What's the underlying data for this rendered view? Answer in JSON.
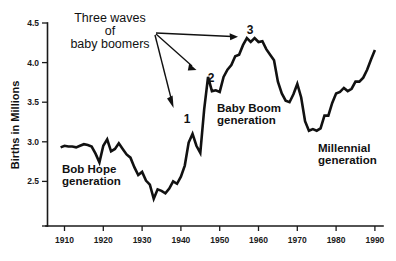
{
  "chart_data": {
    "type": "line",
    "title": "",
    "subtitle": "",
    "xlabel": "",
    "ylabel": "Births in Millions",
    "xlim": [
      1905,
      1992
    ],
    "ylim": [
      2.22,
      4.55
    ],
    "grid": false,
    "legend_position": "none",
    "xticks": [
      "1910",
      "1920",
      "1930",
      "1940",
      "1950",
      "1960",
      "1970",
      "1980",
      "1990"
    ],
    "xtick_values": [
      1910,
      1920,
      1930,
      1940,
      1950,
      1960,
      1970,
      1980,
      1990
    ],
    "yticks": [
      "2.5",
      "3.0",
      "3.5",
      "4.0",
      "4.5"
    ],
    "ytick_values": [
      2.5,
      3.0,
      3.5,
      4.0,
      4.5
    ],
    "series": [
      {
        "name": "Births in Millions",
        "x": [
          1909,
          1910,
          1911,
          1912,
          1913,
          1914,
          1915,
          1916,
          1917,
          1918,
          1919,
          1920,
          1921,
          1922,
          1923,
          1924,
          1925,
          1926,
          1927,
          1928,
          1929,
          1930,
          1931,
          1932,
          1933,
          1934,
          1935,
          1936,
          1937,
          1938,
          1939,
          1940,
          1941,
          1942,
          1943,
          1944,
          1945,
          1946,
          1947,
          1948,
          1949,
          1950,
          1951,
          1952,
          1953,
          1954,
          1955,
          1956,
          1957,
          1958,
          1959,
          1960,
          1961,
          1962,
          1963,
          1964,
          1965,
          1966,
          1967,
          1968,
          1969,
          1970,
          1971,
          1972,
          1973,
          1974,
          1975,
          1976,
          1977,
          1978,
          1979,
          1980,
          1981,
          1982,
          1983,
          1984,
          1985,
          1986,
          1987,
          1988,
          1989,
          1990
        ],
        "y": [
          2.93,
          2.95,
          2.94,
          2.94,
          2.93,
          2.95,
          2.97,
          2.96,
          2.94,
          2.85,
          2.74,
          2.95,
          3.03,
          2.88,
          2.91,
          2.98,
          2.91,
          2.84,
          2.8,
          2.68,
          2.58,
          2.62,
          2.51,
          2.46,
          2.28,
          2.4,
          2.38,
          2.35,
          2.41,
          2.5,
          2.47,
          2.56,
          2.7,
          2.99,
          3.1,
          2.95,
          2.86,
          3.41,
          3.82,
          3.64,
          3.65,
          3.63,
          3.82,
          3.91,
          3.97,
          4.08,
          4.1,
          4.22,
          4.31,
          4.26,
          4.31,
          4.26,
          4.27,
          4.17,
          4.1,
          4.03,
          3.76,
          3.61,
          3.52,
          3.5,
          3.6,
          3.73,
          3.56,
          3.26,
          3.14,
          3.16,
          3.14,
          3.17,
          3.33,
          3.33,
          3.49,
          3.61,
          3.63,
          3.68,
          3.64,
          3.67,
          3.76,
          3.76,
          3.81,
          3.91,
          4.04,
          4.16
        ]
      }
    ],
    "annotations": [
      {
        "name": "three-waves-note",
        "text_lines": [
          "Three waves",
          "of",
          "baby boomers"
        ],
        "arrows_to": [
          "1",
          "2",
          "3"
        ]
      },
      {
        "name": "wave-marker-1",
        "text": "1",
        "x": 1943,
        "y": 3.1
      },
      {
        "name": "wave-marker-2",
        "text": "2",
        "x": 1947,
        "y": 3.82
      },
      {
        "name": "wave-marker-3",
        "text": "3",
        "x": 1957,
        "y": 4.31
      },
      {
        "name": "bob-hope-generation",
        "text_lines": [
          "Bob Hope",
          "generation"
        ]
      },
      {
        "name": "baby-boom-generation",
        "text_lines": [
          "Baby Boom",
          "generation"
        ]
      },
      {
        "name": "millennial-generation",
        "text_lines": [
          "Millennial",
          "generation"
        ]
      }
    ],
    "colors": {
      "line": "#111111",
      "axis": "#1a1a1a",
      "text": "#111111",
      "background": "#ffffff"
    }
  },
  "axes": {
    "ylabel": "Births in Millions",
    "ytick_labels": [
      "4.5",
      "4.0",
      "3.5",
      "3.0",
      "2.5"
    ],
    "xtick_labels": [
      "1910",
      "1920",
      "1930",
      "1940",
      "1950",
      "1960",
      "1970",
      "1980",
      "1990"
    ]
  },
  "annotations": {
    "three_waves_line1": "Three waves",
    "three_waves_line2": "of",
    "three_waves_line3": "baby boomers",
    "marker_1": "1",
    "marker_2": "2",
    "marker_3": "3",
    "bob_hope_line1": "Bob Hope",
    "bob_hope_line2": "generation",
    "baby_boom_line1": "Baby Boom",
    "baby_boom_line2": "generation",
    "millennial_line1": "Millennial",
    "millennial_line2": "generation"
  }
}
